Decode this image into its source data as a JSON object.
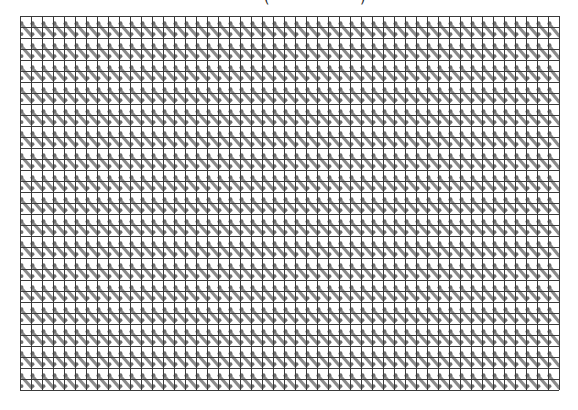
{
  "title_fragments": {
    "left": "(",
    "right": ")"
  },
  "grid": {
    "x": 20,
    "y": 16,
    "cols": 49,
    "rows": 34,
    "cell": 11,
    "line_color": "#3a3a3a",
    "stroke_color": "#8c8c8c",
    "dot_color": "#6e6e6e",
    "background": "#ffffff"
  }
}
